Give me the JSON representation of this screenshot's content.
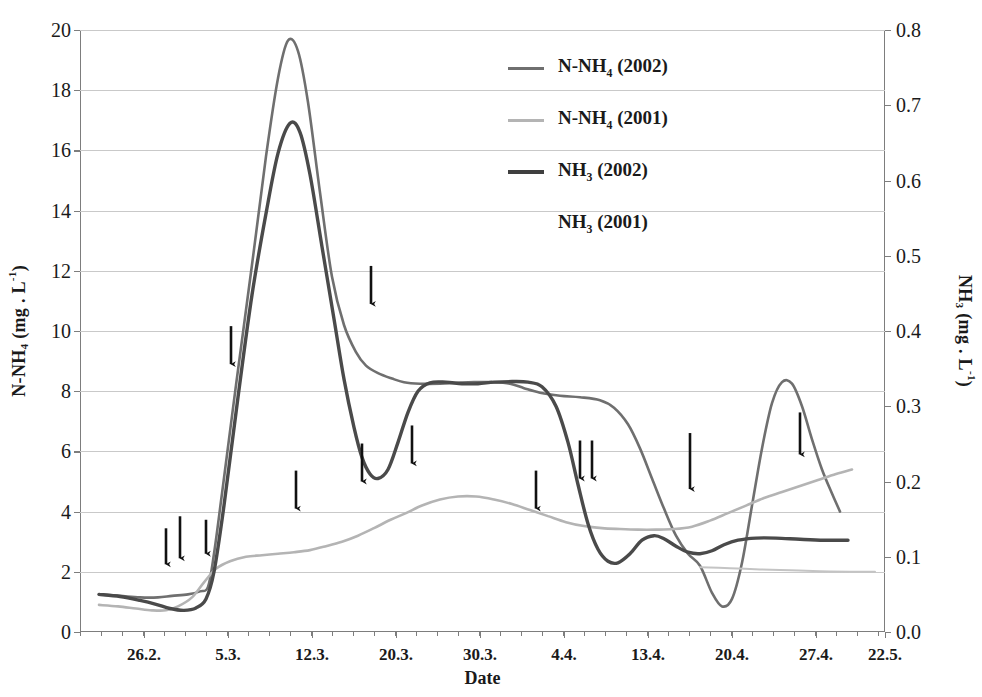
{
  "chart_data": {
    "type": "line",
    "title": "",
    "xlabel": "Date",
    "ylabel_left": "N-NH4 (mg . L-1)",
    "ylabel_right": "NH3 (mg . L-1)",
    "grid": true,
    "legend_position": "inside-top-center",
    "x_categories": [
      "26.2.",
      "5.3.",
      "12.3.",
      "20.3.",
      "30.3.",
      "4.4.",
      "13.4.",
      "20.4.",
      "27.4.",
      "22.5."
    ],
    "x_tick_positions_px": [
      144,
      228,
      312,
      396,
      480,
      564,
      648,
      732,
      816,
      885
    ],
    "ylim_left": [
      0,
      20
    ],
    "ylim_right": [
      0.0,
      0.8
    ],
    "yticks_left": [
      "0",
      "2",
      "4",
      "6",
      "8",
      "10",
      "12",
      "14",
      "16",
      "18",
      "20"
    ],
    "yticks_right": [
      "0.0",
      "0.1",
      "0.2",
      "0.3",
      "0.4",
      "0.5",
      "0.6",
      "0.7",
      "0.8"
    ],
    "series": [
      {
        "name": "N-NH4 (2002)",
        "axis": "left",
        "color": "#6f6f6f",
        "width": 2.6,
        "points": [
          [
            99,
            1.25
          ],
          [
            120,
            1.2
          ],
          [
            140,
            1.15
          ],
          [
            158,
            1.15
          ],
          [
            172,
            1.2
          ],
          [
            188,
            1.25
          ],
          [
            200,
            1.35
          ],
          [
            208,
            1.5
          ],
          [
            214,
            2.6
          ],
          [
            222,
            4.6
          ],
          [
            236,
            8.2
          ],
          [
            252,
            12.2
          ],
          [
            266,
            15.8
          ],
          [
            278,
            18.4
          ],
          [
            288,
            19.65
          ],
          [
            298,
            19.3
          ],
          [
            308,
            17.6
          ],
          [
            320,
            14.6
          ],
          [
            332,
            11.8
          ],
          [
            344,
            10.2
          ],
          [
            356,
            9.3
          ],
          [
            366,
            8.85
          ],
          [
            378,
            8.6
          ],
          [
            392,
            8.42
          ],
          [
            404,
            8.3
          ],
          [
            420,
            8.25
          ],
          [
            440,
            8.25
          ],
          [
            458,
            8.28
          ],
          [
            474,
            8.3
          ],
          [
            492,
            8.3
          ],
          [
            510,
            8.25
          ],
          [
            524,
            8.1
          ],
          [
            540,
            7.95
          ],
          [
            560,
            7.85
          ],
          [
            580,
            7.8
          ],
          [
            600,
            7.7
          ],
          [
            614,
            7.45
          ],
          [
            628,
            6.9
          ],
          [
            640,
            6.1
          ],
          [
            652,
            5.1
          ],
          [
            664,
            4.1
          ],
          [
            676,
            3.2
          ],
          [
            688,
            2.6
          ],
          [
            700,
            2.2
          ],
          [
            712,
            1.3
          ],
          [
            722,
            0.85
          ],
          [
            732,
            1.1
          ],
          [
            742,
            2.3
          ],
          [
            752,
            4.2
          ],
          [
            762,
            6.1
          ],
          [
            772,
            7.6
          ],
          [
            782,
            8.3
          ],
          [
            792,
            8.25
          ],
          [
            802,
            7.5
          ],
          [
            812,
            6.4
          ],
          [
            822,
            5.4
          ],
          [
            832,
            4.6
          ],
          [
            840,
            4.0
          ]
        ]
      },
      {
        "name": "N-NH4 (2001)",
        "axis": "left",
        "color": "#b4b4b4",
        "width": 2.6,
        "points": [
          [
            99,
            0.9
          ],
          [
            118,
            0.85
          ],
          [
            136,
            0.78
          ],
          [
            152,
            0.72
          ],
          [
            166,
            0.72
          ],
          [
            178,
            0.85
          ],
          [
            192,
            1.15
          ],
          [
            204,
            1.65
          ],
          [
            216,
            2.1
          ],
          [
            230,
            2.35
          ],
          [
            246,
            2.5
          ],
          [
            262,
            2.55
          ],
          [
            278,
            2.6
          ],
          [
            294,
            2.65
          ],
          [
            310,
            2.72
          ],
          [
            326,
            2.85
          ],
          [
            342,
            3.0
          ],
          [
            358,
            3.2
          ],
          [
            374,
            3.45
          ],
          [
            390,
            3.72
          ],
          [
            406,
            3.95
          ],
          [
            422,
            4.2
          ],
          [
            440,
            4.4
          ],
          [
            458,
            4.5
          ],
          [
            476,
            4.5
          ],
          [
            494,
            4.4
          ],
          [
            512,
            4.25
          ],
          [
            530,
            4.05
          ],
          [
            548,
            3.85
          ],
          [
            566,
            3.65
          ],
          [
            584,
            3.52
          ],
          [
            602,
            3.45
          ],
          [
            620,
            3.42
          ],
          [
            638,
            3.4
          ],
          [
            656,
            3.4
          ],
          [
            674,
            3.42
          ],
          [
            692,
            3.5
          ],
          [
            710,
            3.7
          ],
          [
            728,
            3.95
          ],
          [
            746,
            4.2
          ],
          [
            764,
            4.45
          ],
          [
            782,
            4.65
          ],
          [
            800,
            4.85
          ],
          [
            818,
            5.05
          ],
          [
            836,
            5.25
          ],
          [
            852,
            5.4
          ]
        ]
      },
      {
        "name": "NH3 (2002)",
        "axis": "right_shown_on_left_scale",
        "color": "#4a4a4a",
        "width": 3.4,
        "points": [
          [
            99,
            1.25
          ],
          [
            120,
            1.18
          ],
          [
            140,
            1.05
          ],
          [
            156,
            0.92
          ],
          [
            170,
            0.78
          ],
          [
            184,
            0.72
          ],
          [
            196,
            0.8
          ],
          [
            206,
            1.1
          ],
          [
            214,
            2.0
          ],
          [
            224,
            4.2
          ],
          [
            238,
            7.8
          ],
          [
            252,
            11.2
          ],
          [
            266,
            13.9
          ],
          [
            278,
            15.9
          ],
          [
            290,
            16.9
          ],
          [
            300,
            16.6
          ],
          [
            310,
            15.2
          ],
          [
            322,
            12.8
          ],
          [
            334,
            10.4
          ],
          [
            344,
            8.4
          ],
          [
            354,
            6.8
          ],
          [
            362,
            5.8
          ],
          [
            370,
            5.25
          ],
          [
            378,
            5.1
          ],
          [
            388,
            5.4
          ],
          [
            398,
            6.3
          ],
          [
            408,
            7.3
          ],
          [
            418,
            8.0
          ],
          [
            430,
            8.28
          ],
          [
            446,
            8.3
          ],
          [
            462,
            8.25
          ],
          [
            478,
            8.25
          ],
          [
            494,
            8.3
          ],
          [
            512,
            8.32
          ],
          [
            528,
            8.3
          ],
          [
            542,
            8.15
          ],
          [
            556,
            7.5
          ],
          [
            568,
            6.3
          ],
          [
            578,
            4.9
          ],
          [
            588,
            3.6
          ],
          [
            598,
            2.75
          ],
          [
            608,
            2.35
          ],
          [
            618,
            2.3
          ],
          [
            630,
            2.6
          ],
          [
            642,
            3.05
          ],
          [
            654,
            3.2
          ],
          [
            664,
            3.1
          ],
          [
            676,
            2.85
          ],
          [
            688,
            2.65
          ],
          [
            700,
            2.6
          ],
          [
            712,
            2.7
          ],
          [
            724,
            2.9
          ],
          [
            738,
            3.05
          ],
          [
            756,
            3.12
          ],
          [
            776,
            3.12
          ],
          [
            800,
            3.08
          ],
          [
            824,
            3.05
          ],
          [
            848,
            3.05
          ]
        ]
      },
      {
        "name": "NH3 (2001)",
        "axis": "right_shown_on_left_scale",
        "color": "#c4c4c4",
        "width": 2.0,
        "points": [
          [
            700,
            2.15
          ],
          [
            730,
            2.12
          ],
          [
            760,
            2.08
          ],
          [
            790,
            2.05
          ],
          [
            820,
            2.02
          ],
          [
            850,
            2.0
          ],
          [
            875,
            2.0
          ]
        ]
      }
    ],
    "annotations": {
      "type": "down-arrow",
      "color": "#111111",
      "description": "Downward arrows marking treatment/sampling events",
      "items": [
        {
          "x": 166,
          "y_value": 2.05,
          "length": 42
        },
        {
          "x": 180,
          "y_value": 2.25,
          "length": 48
        },
        {
          "x": 206,
          "y_value": 2.4,
          "length": 40
        },
        {
          "x": 231,
          "y_value": 8.7,
          "length": 44
        },
        {
          "x": 296,
          "y_value": 3.9,
          "length": 44
        },
        {
          "x": 362,
          "y_value": 4.8,
          "length": 44
        },
        {
          "x": 371,
          "y_value": 10.7,
          "length": 44
        },
        {
          "x": 412,
          "y_value": 5.4,
          "length": 44
        },
        {
          "x": 536,
          "y_value": 3.9,
          "length": 44
        },
        {
          "x": 580,
          "y_value": 4.9,
          "length": 44
        },
        {
          "x": 592,
          "y_value": 4.9,
          "length": 44
        },
        {
          "x": 690,
          "y_value": 4.55,
          "length": 62
        },
        {
          "x": 800,
          "y_value": 5.7,
          "length": 48
        }
      ]
    }
  },
  "legend": {
    "entries": [
      {
        "label": "N-NH",
        "sub": "4",
        "suffix": " (2002)",
        "color": "#6f6f6f",
        "width": 3,
        "has_swatch": true
      },
      {
        "label": "N-NH",
        "sub": "4",
        "suffix": " (2001)",
        "color": "#b4b4b4",
        "width": 3,
        "has_swatch": true
      },
      {
        "label": "NH",
        "sub": "3",
        "suffix": " (2002)",
        "color": "#3f3f3f",
        "width": 4,
        "has_swatch": true
      },
      {
        "label": "NH",
        "sub": "3",
        "suffix": " (2001)",
        "color": "#c4c4c4",
        "width": 2,
        "has_swatch": false
      }
    ]
  },
  "axes": {
    "left_title_main": "N-NH",
    "left_title_sub": "4",
    "left_title_unit": " (mg . L",
    "left_title_sup": "-1",
    "left_title_close": ")",
    "right_title_main": "NH",
    "right_title_sub": "3",
    "right_title_unit": " (mg . L",
    "right_title_sup": "-1",
    "right_title_close": ")",
    "bottom_title": "Date"
  }
}
